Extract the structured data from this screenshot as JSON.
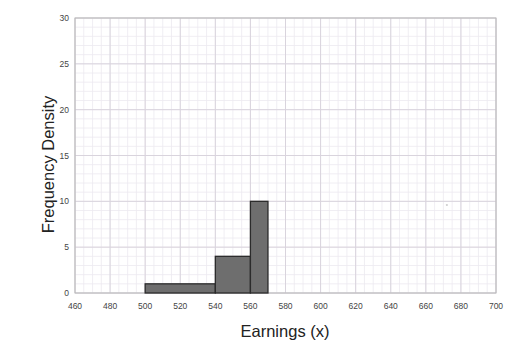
{
  "chart_data": {
    "type": "bar",
    "title": "",
    "subtitle": "",
    "xlabel": "Earnings (x)",
    "ylabel": "Frequency Density",
    "xlim": [
      460,
      700
    ],
    "ylim": [
      0,
      30
    ],
    "xticks": [
      460,
      480,
      500,
      520,
      540,
      560,
      580,
      600,
      620,
      640,
      660,
      680,
      700
    ],
    "yticks": [
      0,
      5,
      10,
      15,
      20,
      25,
      30
    ],
    "grid": true,
    "grid_style": "graph-paper-minor-and-major",
    "legend": null,
    "legend_position": "none",
    "bars": [
      {
        "x_start": 500,
        "x_end": 540,
        "value": 1
      },
      {
        "x_start": 540,
        "x_end": 560,
        "value": 4
      },
      {
        "x_start": 560,
        "x_end": 570,
        "value": 10
      }
    ],
    "categories": [
      "500-540",
      "540-560",
      "560-570"
    ],
    "values": [
      1,
      4,
      10
    ],
    "colors": {
      "bar_fill": "#6e6e6e",
      "bar_edge": "#2b2b2b",
      "axis_line": "#b8b8b8",
      "grid_major": "#d9d4dd",
      "grid_minor": "#eceaf0",
      "text": "#222222",
      "tick_text": "#444444",
      "background": "#ffffff"
    },
    "annotations": [
      {
        "name": "stray-speck",
        "x": 672,
        "y": 9.6
      }
    ]
  }
}
